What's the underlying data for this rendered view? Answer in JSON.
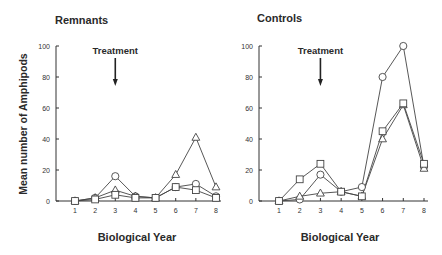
{
  "ylabel": "Mean number of Amphipods",
  "chart_data": [
    {
      "type": "line",
      "title": "Remnants",
      "xlabel": "Biological Year",
      "ylabel": "Mean number of Amphipods",
      "x": [
        1,
        2,
        3,
        4,
        5,
        6,
        7,
        8
      ],
      "xticks": [
        "1",
        "2",
        "3",
        "4",
        "5",
        "6",
        "7",
        "8"
      ],
      "yticks": [
        "0",
        "20",
        "40",
        "60",
        "80",
        "100"
      ],
      "ylim": [
        0,
        100
      ],
      "annotation": {
        "text": "Treatment",
        "x": 3
      },
      "series": [
        {
          "name": "circle",
          "marker": "circle",
          "values": [
            0,
            2,
            16,
            3,
            2,
            9,
            11,
            3
          ]
        },
        {
          "name": "triangle",
          "marker": "triangle",
          "values": [
            0,
            2,
            7,
            3,
            2,
            17,
            41,
            9
          ]
        },
        {
          "name": "square",
          "marker": "square",
          "values": [
            0,
            1,
            4,
            2,
            2,
            9,
            7,
            2
          ]
        }
      ]
    },
    {
      "type": "line",
      "title": "Controls",
      "xlabel": "Biological Year",
      "ylabel": "",
      "x": [
        1,
        2,
        3,
        4,
        5,
        6,
        7,
        8
      ],
      "xticks": [
        "1",
        "2",
        "3",
        "4",
        "5",
        "6",
        "7",
        "8"
      ],
      "yticks": [
        "0",
        "20",
        "40",
        "60",
        "80",
        "100"
      ],
      "ylim": [
        0,
        100
      ],
      "annotation": {
        "text": "Treatment",
        "x": 3
      },
      "series": [
        {
          "name": "circle",
          "marker": "circle",
          "values": [
            0,
            1,
            17,
            6,
            9,
            80,
            100,
            22
          ]
        },
        {
          "name": "triangle",
          "marker": "triangle",
          "values": [
            0,
            3,
            5,
            6,
            3,
            40,
            62,
            21
          ]
        },
        {
          "name": "square",
          "marker": "square",
          "values": [
            0,
            14,
            24,
            6,
            3,
            45,
            63,
            24
          ]
        }
      ]
    }
  ]
}
